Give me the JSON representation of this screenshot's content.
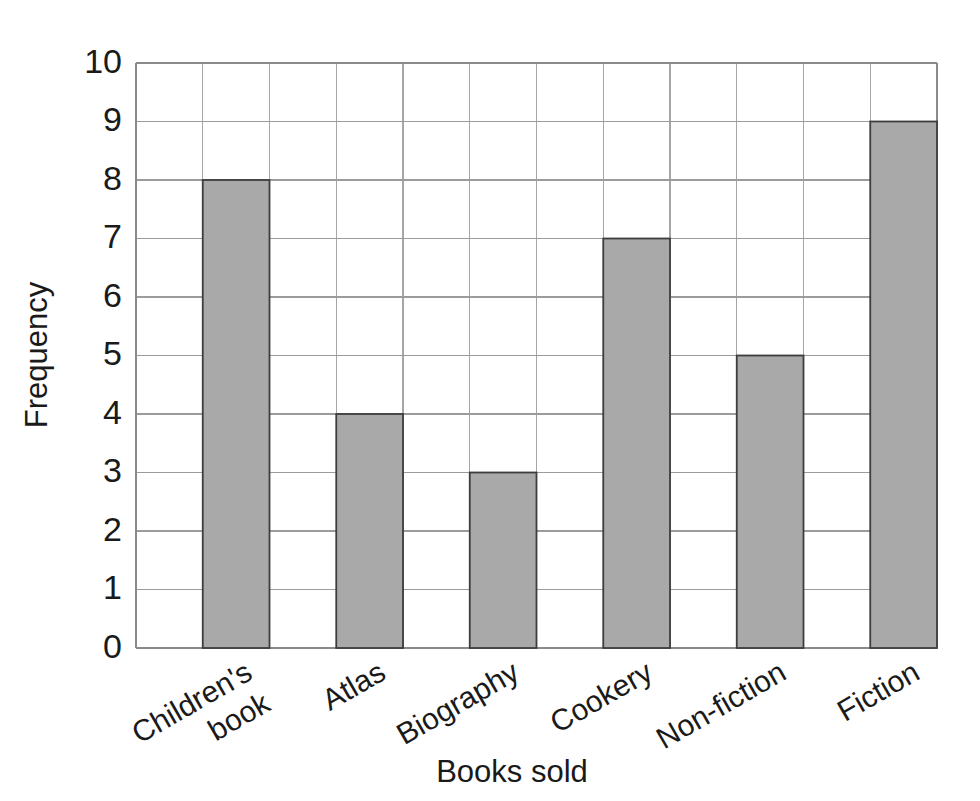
{
  "chart_data": {
    "type": "bar",
    "title": "",
    "subtitle": "",
    "xlabel": "Books sold",
    "ylabel": "Frequency",
    "categories": [
      "Children's book",
      "Atlas",
      "Biography",
      "Cookery",
      "Non-fiction",
      "Fiction"
    ],
    "category_lines": [
      [
        "Children's",
        "book"
      ],
      [
        "Atlas"
      ],
      [
        "Biography"
      ],
      [
        "Cookery"
      ],
      [
        "Non-fiction"
      ],
      [
        "Fiction"
      ]
    ],
    "values": [
      8,
      4,
      3,
      7,
      5,
      9
    ],
    "ylim": [
      0,
      10
    ],
    "ytick_labels": [
      "0",
      "1",
      "2",
      "3",
      "4",
      "5",
      "6",
      "7",
      "8",
      "9",
      "10"
    ],
    "ytick_values": [
      0,
      1,
      2,
      3,
      4,
      5,
      6,
      7,
      8,
      9,
      10
    ],
    "grid": "both",
    "legend": "none",
    "bar_fill": "#a9a9a9",
    "bar_edge": "#3d3d3d",
    "gridline_color": "#9b9b9b",
    "axis_color": "#8a8a8a",
    "text_color": "#1a1a1a",
    "background": "#ffffff",
    "xtick_label_rotation": -30
  },
  "geometry": {
    "plot_left": 136,
    "plot_right": 937,
    "plot_top": 63,
    "plot_bottom": 648,
    "cells_x": 12,
    "bar_cell_indices": [
      1,
      3,
      5,
      7,
      9,
      11
    ]
  }
}
